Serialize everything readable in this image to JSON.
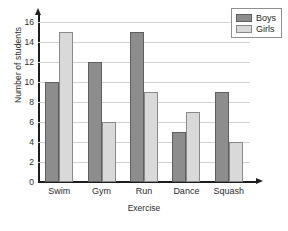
{
  "chart_data": {
    "type": "bar",
    "title": "",
    "xlabel": "Exercise",
    "ylabel": "Number of students",
    "categories": [
      "Swim",
      "Gym",
      "Run",
      "Dance",
      "Squash"
    ],
    "series": [
      {
        "name": "Boys",
        "values": [
          10,
          12,
          15,
          5,
          9
        ],
        "color": "#8d8d8d"
      },
      {
        "name": "Girls",
        "values": [
          15,
          6,
          9,
          7,
          4
        ],
        "color": "#d9d9d9"
      }
    ],
    "ylim": [
      0,
      16
    ],
    "ytick_labels": [
      "0",
      "2",
      "4",
      "6",
      "8",
      "10",
      "12",
      "14",
      "16"
    ],
    "ytick_values": [
      0,
      2,
      4,
      6,
      8,
      10,
      12,
      14,
      16
    ],
    "grid": true,
    "legend_position": "top-right"
  },
  "legend": {
    "entries": [
      {
        "label": "Boys"
      },
      {
        "label": "Girls"
      }
    ]
  }
}
